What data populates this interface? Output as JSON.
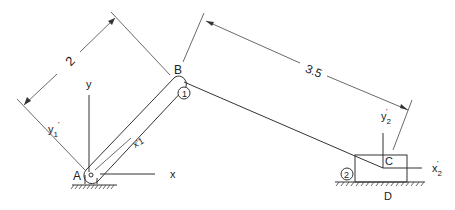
{
  "diagram": {
    "type": "slider-crank mechanism",
    "points": {
      "A": {
        "label": "A"
      },
      "B": {
        "label": "B"
      },
      "C": {
        "label": "C"
      },
      "D": {
        "label": "D"
      }
    },
    "links": [
      {
        "id": "link-1",
        "number_label": "1",
        "from": "A",
        "to": "B"
      },
      {
        "id": "link-2",
        "number_label": "2",
        "from": "B",
        "to": "C"
      }
    ],
    "dimensions": [
      {
        "id": "dim-AB",
        "value": "2"
      },
      {
        "id": "dim-BC",
        "value": "3.5"
      }
    ],
    "axes": {
      "global_x": "x",
      "global_y": "y",
      "local_x1": "x'1",
      "local_y1": "y'1",
      "local_x2": "x'2",
      "local_y2": "y'2"
    }
  }
}
